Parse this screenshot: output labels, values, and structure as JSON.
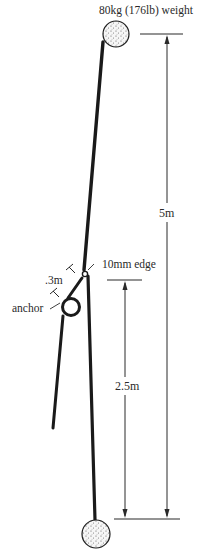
{
  "diagram": {
    "type": "fall-factor rope diagram",
    "labels": {
      "top_weight": "80kg (176lb) weight",
      "total_height": "5m",
      "edge": "10mm edge",
      "anchor_offset": ".3m",
      "anchor": "anchor",
      "lower_height": "2.5m"
    },
    "colors": {
      "ink": "#1e1e1e",
      "rope": "#1a1a1a",
      "weight_fill": "#f4f4f4",
      "background": "#ffffff"
    },
    "dimensions": {
      "total_drop_m": 5,
      "lower_segment_m": 2.5,
      "anchor_offset_m": 0.3,
      "edge_radius_mm": 10,
      "weight_kg": 80,
      "weight_lb": 176
    }
  }
}
